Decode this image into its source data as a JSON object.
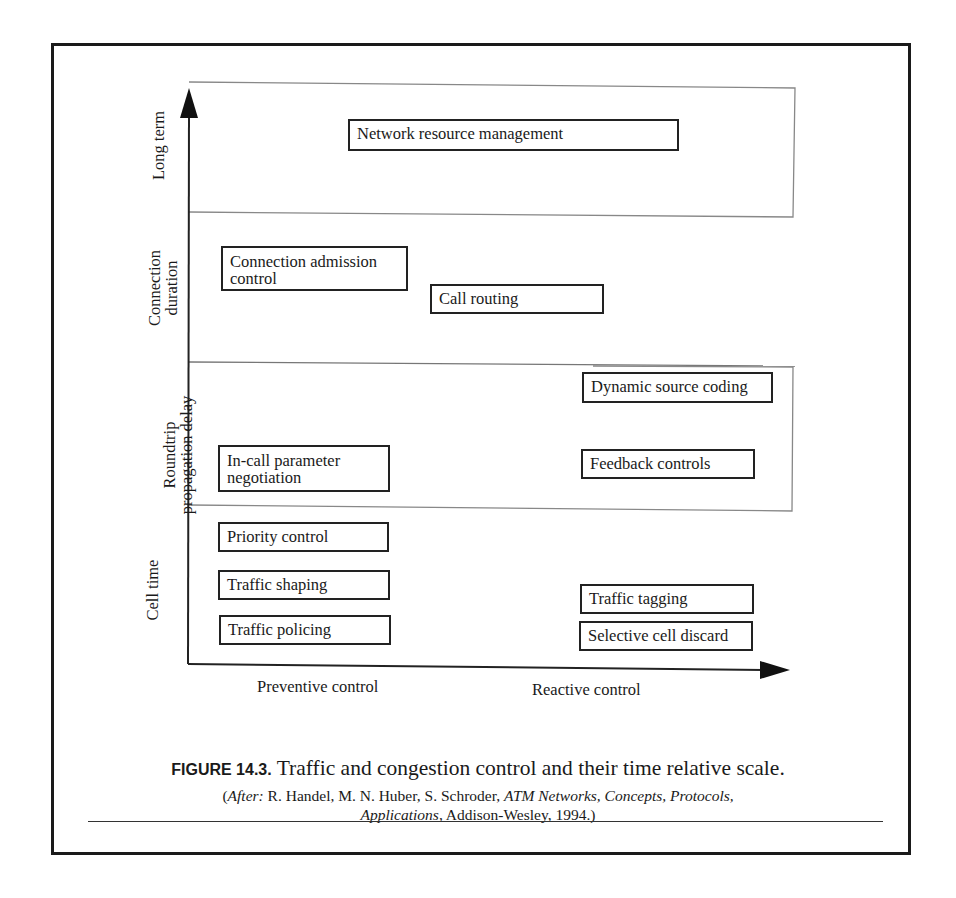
{
  "figure": {
    "y_axis_bands": [
      {
        "label_lines": [
          "Long term"
        ]
      },
      {
        "label_lines": [
          "Connection",
          "duration"
        ]
      },
      {
        "label_lines": [
          "Roundtrip",
          "propagation delay"
        ]
      },
      {
        "label_lines": [
          "Cell time"
        ]
      }
    ],
    "x_axis_labels": {
      "preventive": "Preventive control",
      "reactive": "Reactive control"
    },
    "boxes": {
      "network_resource_management": "Network resource management",
      "connection_admission_control": [
        "Connection admission",
        "control"
      ],
      "call_routing": "Call routing",
      "dynamic_source_coding": "Dynamic source coding",
      "in_call_parameter_negotiation": [
        "In-call parameter",
        "negotiation"
      ],
      "feedback_controls": "Feedback controls",
      "priority_control": "Priority control",
      "traffic_shaping": "Traffic shaping",
      "traffic_policing": "Traffic policing",
      "traffic_tagging": "Traffic tagging",
      "selective_cell_discard": "Selective cell discard"
    }
  },
  "caption": {
    "number": "FIGURE 14.3.",
    "title": " Traffic and congestion control and their time relative scale.",
    "source_open": "(",
    "source_after": "After:",
    "source_authors": " R. Handel, M. N. Huber, S. Schroder, ",
    "source_book": "ATM Networks, Concepts, Protocols,",
    "source_book_line2": "Applications",
    "source_rest": ", Addison-Wesley, 1994.)"
  }
}
